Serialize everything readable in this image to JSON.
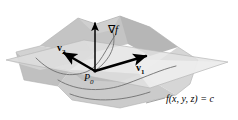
{
  "figure": {
    "kind": "math-diagram",
    "background_color": "#ffffff",
    "width": 238,
    "height": 120
  },
  "labels": {
    "gradient": {
      "operator": "∇",
      "function": "f",
      "text": "∇f",
      "name": "gradient-vector-label"
    },
    "tangent_vector_1": {
      "base": "v",
      "subscript": "1",
      "text": "v1",
      "name": "tangent-vector-1-label"
    },
    "tangent_vector_2": {
      "base": "v",
      "subscript": "2",
      "text": "v2",
      "name": "tangent-vector-2-label"
    },
    "point": {
      "base": "P",
      "subscript": "0",
      "text": "P0",
      "name": "point-p0-label"
    },
    "surface_equation": {
      "text": "f(x, y, z) = c",
      "name": "level-surface-equation-label"
    }
  },
  "colors": {
    "background": "#ffffff",
    "surface_light": "#dcdcdc",
    "surface_mid": "#c9c9c9",
    "surface_dark": "#b4b4b4",
    "surface_darker": "#a2a2a2",
    "plane_light": "#e6e6e6",
    "plane_shadow": "#cfcfcf",
    "ink": "#000000",
    "curve": "#6e6e6e",
    "leader": "#8a8a8a"
  },
  "geometry": {
    "origin": {
      "x": 95,
      "y": 71
    },
    "gradient_tip": {
      "x": 95,
      "y": 23
    },
    "v1_tip": {
      "x": 146,
      "y": 56
    },
    "v2_tip": {
      "x": 64,
      "y": 53
    }
  }
}
